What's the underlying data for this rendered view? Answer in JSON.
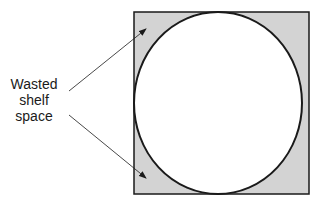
{
  "diagram": {
    "label_lines": [
      "Wasted",
      "shelf",
      "space"
    ],
    "colors": {
      "square_fill": "#d3d3d3",
      "circle_fill": "#ffffff",
      "stroke": "#1a1a1a"
    }
  }
}
